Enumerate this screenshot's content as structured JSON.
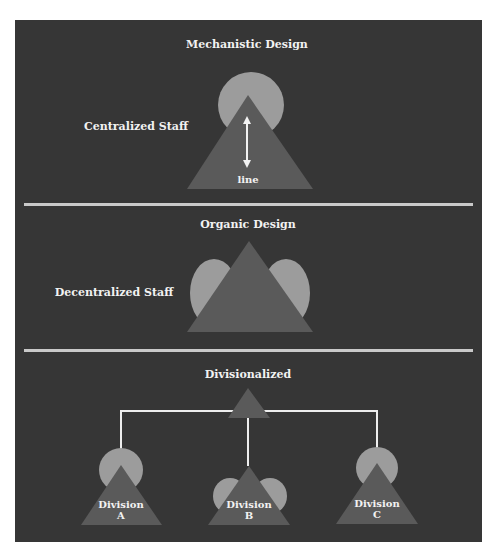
{
  "colors": {
    "background": "#363636",
    "triangle": "#5a5a5a",
    "staff_circle": "#9c9c9c",
    "divider": "#c9c9c9",
    "text": "#f2f2f2",
    "connector": "#eeeeee"
  },
  "sections": {
    "mechanistic": {
      "title": "Mechanistic Design",
      "staff_label": "Centralized Staff",
      "line_label": "line"
    },
    "organic": {
      "title": "Organic Design",
      "staff_label": "Decentralized Staff"
    },
    "divisionalized": {
      "title": "Divisionalized",
      "divisions": [
        {
          "line1": "Division",
          "line2": "A"
        },
        {
          "line1": "Division",
          "line2": "B"
        },
        {
          "line1": "Division",
          "line2": "C"
        }
      ]
    }
  }
}
